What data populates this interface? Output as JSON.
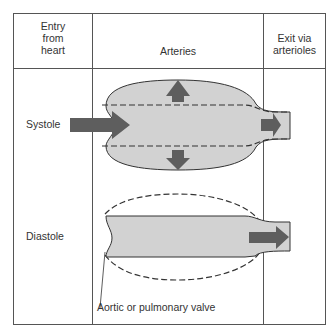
{
  "headers": {
    "entry": [
      "Entry",
      "from",
      "heart"
    ],
    "arteries": "Arteries",
    "exit": [
      "Exit via",
      "arterioles"
    ]
  },
  "rows": {
    "systole": "Systole",
    "diastole": "Diastole"
  },
  "annotation": "Aortic or pulmonary valve",
  "colors": {
    "vessel_fill": "#d2d2d2",
    "arrow_fill": "#5e5e5e",
    "line": "#333333",
    "grid": "#555555"
  }
}
